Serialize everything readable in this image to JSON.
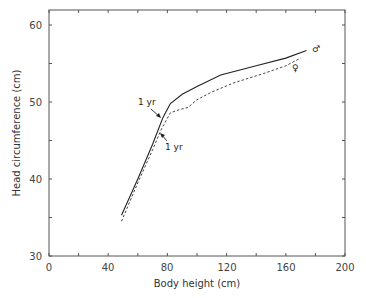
{
  "chart_data": {
    "type": "line",
    "title": "",
    "xlabel": "Body height (cm)",
    "ylabel": "Head circumference (cm)",
    "xlim": [
      0,
      200
    ],
    "ylim": [
      30,
      62
    ],
    "x_ticks": [
      0,
      40,
      80,
      120,
      160,
      200
    ],
    "y_ticks": [
      30,
      40,
      50,
      60
    ],
    "grid": false,
    "legend": "none (symbols at line ends)",
    "series": [
      {
        "name": "male",
        "symbol": "♂",
        "style": "solid",
        "x": [
          49,
          60,
          70,
          77,
          82,
          90,
          100,
          116,
          140,
          160,
          174
        ],
        "y": [
          35.3,
          40.0,
          44.5,
          48.0,
          49.8,
          51.0,
          52.0,
          53.5,
          54.7,
          55.7,
          56.7
        ]
      },
      {
        "name": "female",
        "symbol": "♀",
        "style": "dashed",
        "x": [
          49,
          60,
          70,
          76,
          82,
          88,
          94,
          100,
          110,
          125,
          145,
          160,
          170
        ],
        "y": [
          34.5,
          39.5,
          43.8,
          46.5,
          48.6,
          49.0,
          49.3,
          50.3,
          51.3,
          52.5,
          53.7,
          54.7,
          55.7
        ]
      }
    ],
    "annotations": [
      {
        "text": "1 yr",
        "series": "male",
        "x": 77,
        "y": 48.0
      },
      {
        "text": "1 yr",
        "series": "female",
        "x": 76,
        "y": 46.5
      },
      {
        "text": "♂",
        "series": "male"
      },
      {
        "text": "♀",
        "series": "female"
      }
    ]
  },
  "labels": {
    "xlabel": "Body height (cm)",
    "ylabel": "Head circumference (cm)",
    "x_ticks": [
      "0",
      "40",
      "80",
      "120",
      "160",
      "200"
    ],
    "y_ticks": [
      "30",
      "40",
      "50",
      "60"
    ],
    "annot_male_1yr": "1 yr",
    "annot_female_1yr": "1 yr",
    "male_symbol": "♂",
    "female_symbol": "♀"
  }
}
